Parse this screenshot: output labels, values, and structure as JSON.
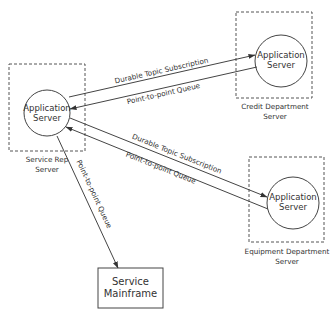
{
  "diagram": {
    "colors": {
      "stroke": "#444444",
      "text": "#333333",
      "background": "#ffffff"
    },
    "nodes": {
      "service_rep": {
        "circle_line1": "Application",
        "circle_line2": "Server",
        "caption_line1": "Service Rep",
        "caption_line2": "Server"
      },
      "credit": {
        "circle_line1": "Application",
        "circle_line2": "Server",
        "caption_line1": "Credit Department",
        "caption_line2": "Server"
      },
      "equipment": {
        "circle_line1": "Application",
        "circle_line2": "Server",
        "caption_line1": "Equipment Department",
        "caption_line2": "Server"
      },
      "mainframe": {
        "line1": "Service",
        "line2": "Mainframe"
      }
    },
    "edges": {
      "rep_to_credit": "Durable Topic Subscription",
      "credit_to_rep": "Point-to-point Queue",
      "rep_to_equipment": "Durable Topic Subscription",
      "equipment_to_rep": "Point-to-point Queue",
      "rep_to_mainframe": "Point-to-point Queue"
    }
  }
}
